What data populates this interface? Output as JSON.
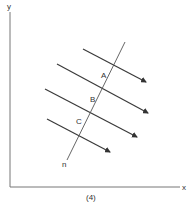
{
  "diagram": {
    "caption": "(4)",
    "axes": {
      "x_label": "x",
      "y_label": "y"
    },
    "line": {
      "label": "n",
      "from": [
        125,
        42
      ],
      "to": [
        67,
        160
      ]
    },
    "points": [
      {
        "label": "A",
        "x": 104,
        "y": 76
      },
      {
        "label": "B",
        "x": 93,
        "y": 100
      },
      {
        "label": "C",
        "x": 79,
        "y": 122
      }
    ],
    "arrows": [
      {
        "from": [
          83,
          49
        ],
        "to": [
          146,
          82
        ]
      },
      {
        "from": [
          57,
          64
        ],
        "to": [
          148,
          113
        ]
      },
      {
        "from": [
          45,
          89
        ],
        "to": [
          137,
          137
        ]
      },
      {
        "from": [
          47,
          119
        ],
        "to": [
          110,
          152
        ]
      }
    ],
    "colors": {
      "line": "#3a3a3a",
      "axis": "#777777",
      "background": "#ffffff"
    }
  }
}
